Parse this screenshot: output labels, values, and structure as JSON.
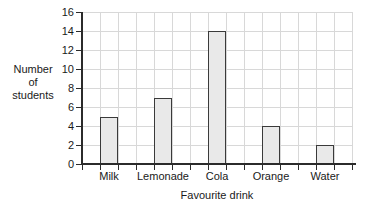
{
  "chart_data": {
    "type": "bar",
    "title": "",
    "categories": [
      "Milk",
      "Lemonade",
      "Cola",
      "Orange",
      "Water"
    ],
    "values": [
      5,
      7,
      14,
      4,
      2
    ],
    "xlabel": "Favourite drink",
    "ylabel": "Number of students",
    "ylabel_lines": [
      "Number",
      "of",
      "students"
    ],
    "ylim": [
      0,
      16
    ],
    "ytick_step": 2,
    "yticks": [
      0,
      2,
      4,
      6,
      8,
      10,
      12,
      14,
      16
    ],
    "ytick_labels": [
      "0",
      "2",
      "4",
      "6",
      "8",
      "10",
      "12",
      "14",
      "16"
    ],
    "grid": true,
    "grid_columns": 15,
    "legend": false,
    "bar_fill_color": "#e9e9e9",
    "bar_border_color": "#3a3a3a",
    "grid_color": "#d8d8d8",
    "axis_color": "#2b2b2b",
    "background_color": "#ffffff"
  }
}
